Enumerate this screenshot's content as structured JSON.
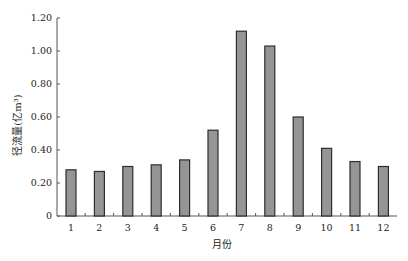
{
  "chart_data": {
    "type": "bar",
    "title": "",
    "xlabel": "月份",
    "ylabel": "径流量(亿m³)",
    "categories": [
      "1",
      "2",
      "3",
      "4",
      "5",
      "6",
      "7",
      "8",
      "9",
      "10",
      "11",
      "12"
    ],
    "values": [
      0.28,
      0.27,
      0.3,
      0.31,
      0.34,
      0.52,
      1.12,
      1.03,
      0.6,
      0.41,
      0.33,
      0.3
    ],
    "ylim": [
      0,
      1.2
    ],
    "yticks": [
      "0",
      "0.20",
      "0.40",
      "0.60",
      "0.80",
      "1.00",
      "1.20"
    ],
    "grid": false,
    "legend": null,
    "colors": {
      "bar_fill": "#959595",
      "bar_stroke": "#2e2e2e",
      "axis": "#555555"
    }
  }
}
